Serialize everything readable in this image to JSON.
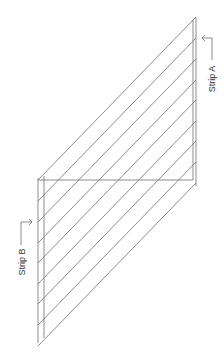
{
  "diagram": {
    "labels": {
      "strip_a": "Strip A",
      "strip_b": "Strip B"
    },
    "line_color": "#6e6e6e",
    "background": "#ffffff",
    "strip_a": {
      "outer_edge": {
        "x": 196,
        "y1": 17,
        "y2": 186
      },
      "inner_edge": {
        "x": 193,
        "y1": 20,
        "y2": 180
      }
    },
    "strip_b": {
      "outer_edge": {
        "x": 38,
        "y1": 178,
        "y2": 343
      },
      "inner_edge": {
        "x": 44,
        "y1": 176,
        "y2": 338
      }
    },
    "fold_line": {
      "y": 180,
      "x1": 38,
      "x2": 193
    },
    "diagonal_count": 9,
    "diagonals": [
      {
        "x1": 196,
        "y1": 17,
        "x2": 38,
        "y2": 180
      },
      {
        "x1": 196,
        "y1": 38,
        "x2": 38,
        "y2": 201
      },
      {
        "x1": 196,
        "y1": 59,
        "x2": 38,
        "y2": 222
      },
      {
        "x1": 196,
        "y1": 80,
        "x2": 38,
        "y2": 243
      },
      {
        "x1": 196,
        "y1": 100,
        "x2": 38,
        "y2": 263
      },
      {
        "x1": 196,
        "y1": 121,
        "x2": 38,
        "y2": 284
      },
      {
        "x1": 196,
        "y1": 141,
        "x2": 38,
        "y2": 304
      },
      {
        "x1": 196,
        "y1": 162,
        "x2": 38,
        "y2": 325
      },
      {
        "x1": 196,
        "y1": 183,
        "x2": 38,
        "y2": 346
      }
    ]
  }
}
